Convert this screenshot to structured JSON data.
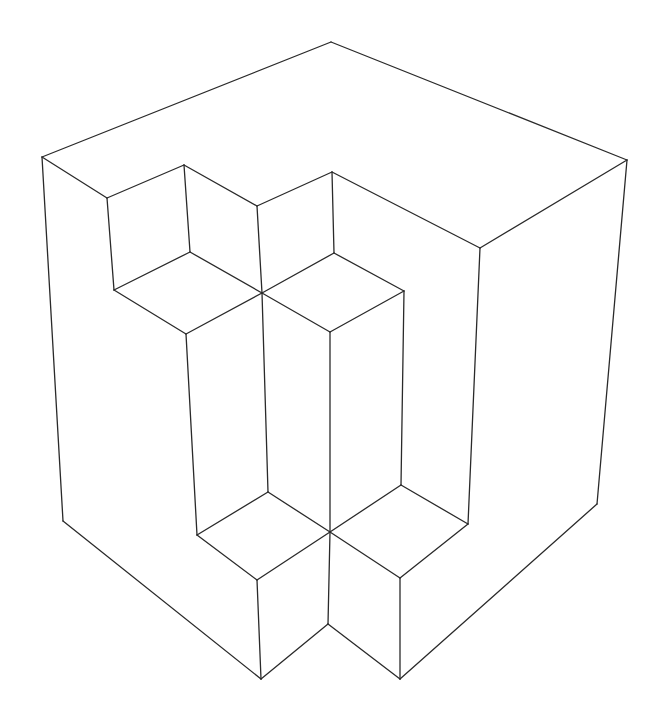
{
  "figure": {
    "stroke_color": "#2a2a2a",
    "background": "#ffffff",
    "edges": [
      [
        42,
        157,
        331,
        42
      ],
      [
        331,
        42,
        627,
        160
      ],
      [
        42,
        157,
        63,
        521
      ],
      [
        627,
        160,
        597,
        504
      ],
      [
        63,
        521,
        261,
        679
      ],
      [
        261,
        679,
        328,
        624
      ],
      [
        328,
        624,
        400,
        679
      ],
      [
        400,
        679,
        597,
        504
      ],
      [
        627,
        160,
        480,
        248
      ],
      [
        480,
        248,
        332,
        172
      ],
      [
        332,
        172,
        257,
        206
      ],
      [
        257,
        206,
        184,
        165
      ],
      [
        184,
        165,
        107,
        198
      ],
      [
        107,
        198,
        42,
        157
      ],
      [
        107,
        198,
        114,
        290
      ],
      [
        184,
        165,
        190,
        252
      ],
      [
        190,
        252,
        114,
        290
      ],
      [
        114,
        290,
        186,
        334
      ],
      [
        186,
        334,
        262,
        293
      ],
      [
        190,
        252,
        262,
        293
      ],
      [
        257,
        206,
        262,
        293
      ],
      [
        332,
        172,
        334,
        253
      ],
      [
        334,
        253,
        262,
        293
      ],
      [
        334,
        253,
        404,
        291
      ],
      [
        404,
        291,
        330,
        332
      ],
      [
        330,
        332,
        262,
        293
      ],
      [
        480,
        248,
        468,
        524
      ],
      [
        404,
        291,
        401,
        485
      ],
      [
        330,
        332,
        330,
        532
      ],
      [
        262,
        293,
        268,
        492
      ],
      [
        186,
        334,
        197,
        535
      ],
      [
        197,
        535,
        268,
        492
      ],
      [
        268,
        492,
        330,
        532
      ],
      [
        197,
        535,
        257,
        580
      ],
      [
        257,
        580,
        330,
        532
      ],
      [
        257,
        580,
        261,
        679
      ],
      [
        330,
        532,
        401,
        485
      ],
      [
        401,
        485,
        468,
        524
      ],
      [
        468,
        524,
        400,
        578
      ],
      [
        400,
        578,
        330,
        532
      ],
      [
        400,
        578,
        400,
        679
      ],
      [
        330,
        532,
        328,
        624
      ]
    ]
  }
}
